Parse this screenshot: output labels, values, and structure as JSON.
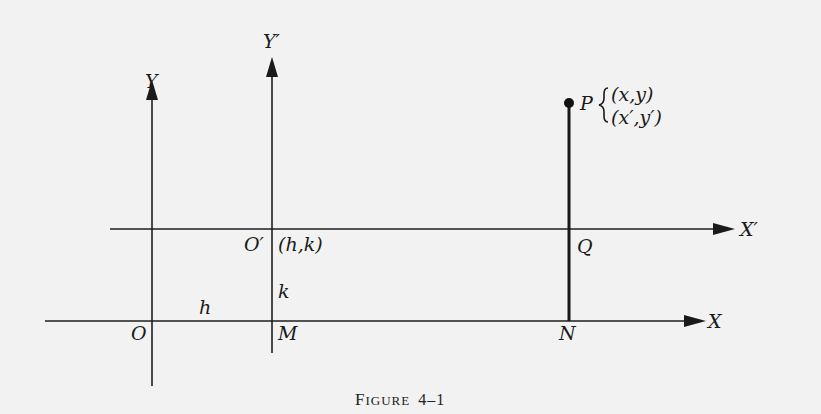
{
  "figure": {
    "caption_first": "F",
    "caption_rest": "IGURE",
    "caption_number": "4–1",
    "axes": {
      "x": "X",
      "y": "Y",
      "x_prime": "X′",
      "y_prime": "Y′"
    },
    "points": {
      "origin": "O",
      "new_origin": "O′",
      "new_origin_coords": "(h,k)",
      "m": "M",
      "n": "N",
      "q": "Q",
      "p": "P",
      "p_coords_old": "(x,y)",
      "p_coords_new": "(x′,y′)"
    },
    "segments": {
      "h": "h",
      "k": "k"
    }
  }
}
